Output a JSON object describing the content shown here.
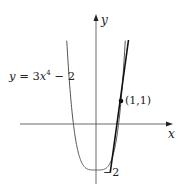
{
  "diagram": {
    "equation_label": "y = 3x⁴ − 2",
    "equation_parts": {
      "lhs": "y = 3",
      "var": "x",
      "exp": "4",
      "rest": " − 2"
    },
    "x_axis_label": "x",
    "y_axis_label": "y",
    "point_label": "(1,1)",
    "intercept_label": "−2",
    "point": {
      "x": 1,
      "y": 1
    },
    "function": "3x^4 - 2",
    "tangent_slope": 12,
    "colors": {
      "curve": "#555555",
      "tangent": "#111111",
      "axes": "#444444"
    }
  }
}
